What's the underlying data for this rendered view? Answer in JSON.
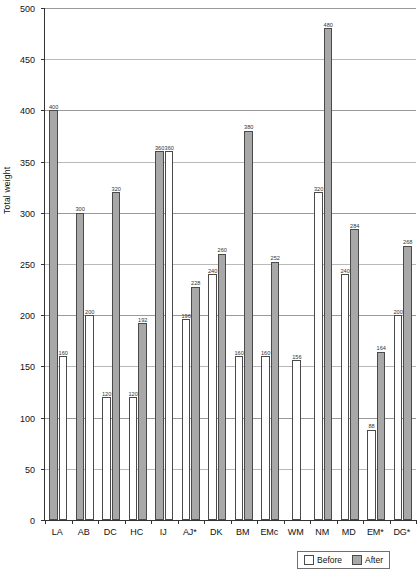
{
  "chart_data": {
    "type": "bar",
    "title": "",
    "xlabel": "",
    "ylabel": "Total weight",
    "ylim": [
      0,
      500
    ],
    "yticks": [
      0,
      50,
      100,
      150,
      200,
      250,
      300,
      350,
      400,
      450,
      500
    ],
    "grid": true,
    "legend_position": "bottom-right",
    "categories": [
      "LA",
      "AB",
      "DC",
      "HC",
      "IJ",
      "AJ*",
      "DK",
      "BM",
      "EMc",
      "WM",
      "NM",
      "MD",
      "EM*",
      "DG*"
    ],
    "series": [
      {
        "name": "Before",
        "color": "#ffffff",
        "values": [
          160,
          200,
          120,
          120,
          360,
          196,
          240,
          160,
          160,
          156,
          320,
          240,
          88,
          200
        ]
      },
      {
        "name": "After",
        "color": "#a8a8a8",
        "values": [
          400,
          300,
          320,
          192,
          360,
          228,
          260,
          380,
          252,
          null,
          480,
          284,
          164,
          268
        ]
      }
    ],
    "bar_order": {
      "note": "within each group the left bar is listed first",
      "groups": [
        {
          "category": "LA",
          "bars": [
            {
              "series": "After",
              "value": 400
            },
            {
              "series": "Before",
              "value": 160
            }
          ]
        },
        {
          "category": "AB",
          "bars": [
            {
              "series": "After",
              "value": 300
            },
            {
              "series": "Before",
              "value": 200
            }
          ]
        },
        {
          "category": "DC",
          "bars": [
            {
              "series": "Before",
              "value": 120
            },
            {
              "series": "After",
              "value": 320
            }
          ]
        },
        {
          "category": "HC",
          "bars": [
            {
              "series": "Before",
              "value": 120
            },
            {
              "series": "After",
              "value": 192
            }
          ]
        },
        {
          "category": "IJ",
          "bars": [
            {
              "series": "After",
              "value": 360
            },
            {
              "series": "Before",
              "value": 360
            }
          ]
        },
        {
          "category": "AJ*",
          "bars": [
            {
              "series": "Before",
              "value": 196
            },
            {
              "series": "After",
              "value": 228
            }
          ]
        },
        {
          "category": "DK",
          "bars": [
            {
              "series": "Before",
              "value": 240
            },
            {
              "series": "After",
              "value": 260
            }
          ]
        },
        {
          "category": "BM",
          "bars": [
            {
              "series": "Before",
              "value": 160
            },
            {
              "series": "After",
              "value": 380
            }
          ]
        },
        {
          "category": "EMc",
          "bars": [
            {
              "series": "Before",
              "value": 160
            },
            {
              "series": "After",
              "value": 252
            }
          ]
        },
        {
          "category": "WM",
          "bars": [
            {
              "series": "Before",
              "value": 156
            }
          ]
        },
        {
          "category": "NM",
          "bars": [
            {
              "series": "Before",
              "value": 320
            },
            {
              "series": "After",
              "value": 480
            }
          ]
        },
        {
          "category": "MD",
          "bars": [
            {
              "series": "Before",
              "value": 240
            },
            {
              "series": "After",
              "value": 284
            }
          ]
        },
        {
          "category": "EM*",
          "bars": [
            {
              "series": "Before",
              "value": 88
            },
            {
              "series": "After",
              "value": 164
            }
          ]
        },
        {
          "category": "DG*",
          "bars": [
            {
              "series": "Before",
              "value": 200
            },
            {
              "series": "After",
              "value": 268
            }
          ]
        }
      ]
    }
  },
  "legend": {
    "before_label": "Before",
    "after_label": "After"
  }
}
